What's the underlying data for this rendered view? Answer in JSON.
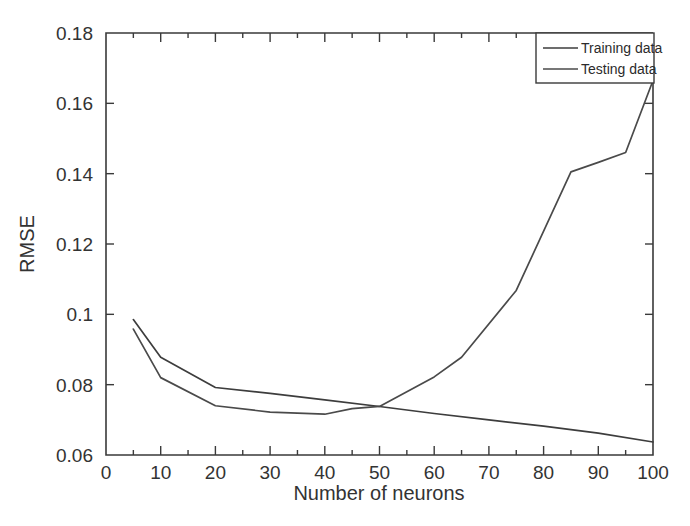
{
  "chart_data": {
    "type": "line",
    "title": "",
    "subtitle": "",
    "xlabel": "Number of neurons",
    "ylabel": "RMSE",
    "xlim": [
      0,
      100
    ],
    "ylim": [
      0.06,
      0.18
    ],
    "xticks": [
      0,
      10,
      20,
      30,
      40,
      50,
      60,
      70,
      80,
      90,
      100
    ],
    "xtick_labels": [
      "0",
      "10",
      "20",
      "30",
      "40",
      "50",
      "60",
      "70",
      "80",
      "90",
      "100"
    ],
    "yticks": [
      0.06,
      0.08,
      0.1,
      0.12,
      0.14,
      0.16,
      0.18
    ],
    "ytick_labels": [
      "0.06",
      "0.08",
      "0.1",
      "0.12",
      "0.14",
      "0.16",
      "0.18"
    ],
    "x_minor_tick_step": 5,
    "grid": false,
    "legend_position": "top-right",
    "legend_entries": [
      "Training data",
      "Testing data"
    ],
    "series": [
      {
        "name": "Training data",
        "color": "#3d3d3d",
        "x": [
          5,
          10,
          20,
          30,
          40,
          50,
          60,
          70,
          80,
          90,
          100
        ],
        "values": [
          0.0985,
          0.0878,
          0.0792,
          0.0775,
          0.0757,
          0.0738,
          0.0718,
          0.07,
          0.0682,
          0.0662,
          0.0637
        ]
      },
      {
        "name": "Testing data",
        "color": "#4a4a4a",
        "x": [
          5,
          10,
          20,
          30,
          40,
          45,
          50,
          60,
          65,
          75,
          85,
          90,
          95,
          100
        ],
        "values": [
          0.0958,
          0.082,
          0.074,
          0.0722,
          0.0716,
          0.0732,
          0.0738,
          0.0822,
          0.0878,
          0.1068,
          0.1405,
          0.1432,
          0.146,
          0.1665
        ]
      }
    ]
  },
  "figure": {
    "background_color": "#ffffff",
    "axis_color": "#3a3a3a",
    "text_color": "#333333"
  }
}
